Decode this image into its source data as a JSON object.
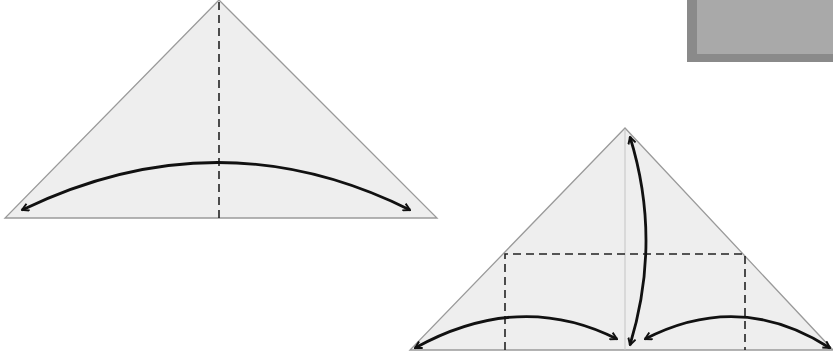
{
  "diagram": {
    "type": "origami-fold-instructions",
    "paper_color": "#eeeeee",
    "outline_color": "#9a9a9a",
    "line_color": "#111111",
    "steps": [
      {
        "id": "step-1",
        "shape": "triangle",
        "creases": [
          "vertical center valley fold (dashed)"
        ],
        "arrows": [
          "fold-and-unfold arc from left corner to right corner"
        ]
      },
      {
        "id": "step-2",
        "shape": "triangle",
        "creases": [
          "faint center crease",
          "dashed horizontal fold line",
          "two dashed vertical fold lines"
        ],
        "arrows": [
          "fold-and-unfold from apex to base center",
          "left corner to base center",
          "right corner to base center"
        ]
      }
    ],
    "photo_thumbnail": {
      "description": "grey textured photo corner"
    }
  }
}
